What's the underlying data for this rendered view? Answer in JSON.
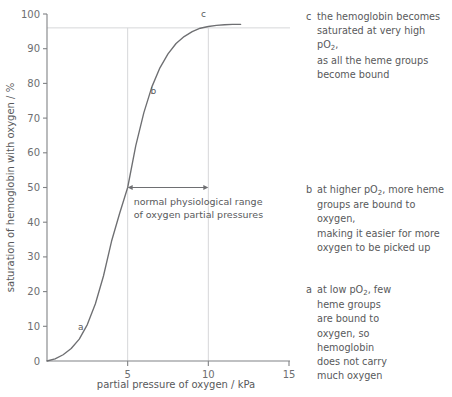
{
  "chart_data": {
    "type": "line",
    "title": "",
    "xlabel": "partial pressure of oxygen / kPa",
    "ylabel": "saturation of hemoglobin with oxygen / %",
    "xlim": [
      0,
      15
    ],
    "ylim": [
      0,
      100
    ],
    "xticks": [
      0,
      5,
      10,
      15
    ],
    "xtick_labels": [
      "0",
      "5",
      "10",
      "15"
    ],
    "yticks": [
      0,
      10,
      20,
      30,
      40,
      50,
      60,
      70,
      80,
      90,
      100
    ],
    "ytick_labels": [
      "0",
      "10",
      "20",
      "30",
      "40",
      "50",
      "60",
      "70",
      "80",
      "90",
      "100"
    ],
    "grid": false,
    "legend": "none",
    "series": [
      {
        "name": "oxyhemoglobin dissociation curve",
        "color": "#6e6f72",
        "x": [
          0.0,
          0.5,
          1.0,
          1.5,
          2.0,
          2.5,
          3.0,
          3.5,
          4.0,
          4.5,
          5.0,
          5.5,
          6.0,
          6.5,
          7.0,
          7.5,
          8.0,
          8.5,
          9.0,
          9.5,
          10.0,
          10.5,
          11.0,
          11.5,
          12.0
        ],
        "y": [
          0.0,
          0.6,
          1.8,
          3.6,
          6.3,
          10.5,
          16.5,
          24.5,
          34.5,
          42.5,
          50.0,
          62.0,
          71.5,
          79.0,
          84.5,
          88.5,
          91.5,
          93.5,
          94.9,
          95.9,
          96.4,
          96.7,
          96.9,
          97.0,
          97.0
        ]
      }
    ],
    "reference_lines": {
      "horizontal": [
        {
          "y": 96,
          "label": ""
        }
      ],
      "vertical": [
        {
          "x": 5,
          "label": ""
        },
        {
          "x": 10,
          "label": ""
        }
      ]
    },
    "curve_point_labels": [
      {
        "id": "a",
        "label": "a",
        "x": 2.1,
        "y": 9
      },
      {
        "id": "b",
        "label": "b",
        "x": 6.6,
        "y": 77
      },
      {
        "id": "c",
        "label": "c",
        "x": 9.7,
        "y": 99
      }
    ],
    "range_arrow": {
      "from_x": 5,
      "to_x": 10,
      "at_y": 50,
      "note_lines": [
        "normal physiological range",
        "of oxygen partial pressures"
      ]
    }
  },
  "annotations": [
    {
      "id": "c",
      "marker": "c",
      "lines": [
        {
          "pre": "the hemoglobin becomes",
          "sub": "",
          "post": ""
        },
        {
          "pre": "saturated at very high pO",
          "sub": "2",
          "post": ","
        },
        {
          "pre": "as all the heme groups",
          "sub": "",
          "post": ""
        },
        {
          "pre": "become bound",
          "sub": "",
          "post": ""
        }
      ]
    },
    {
      "id": "b",
      "marker": "b",
      "lines": [
        {
          "pre": "at higher pO",
          "sub": "2",
          "post": ", more heme"
        },
        {
          "pre": "groups are bound to oxygen,",
          "sub": "",
          "post": ""
        },
        {
          "pre": "making it easier for more",
          "sub": "",
          "post": ""
        },
        {
          "pre": "oxygen to be picked up",
          "sub": "",
          "post": ""
        }
      ]
    },
    {
      "id": "a",
      "marker": "a",
      "lines": [
        {
          "pre": "at low pO",
          "sub": "2",
          "post": ", few"
        },
        {
          "pre": "heme groups",
          "sub": "",
          "post": ""
        },
        {
          "pre": "are bound to",
          "sub": "",
          "post": ""
        },
        {
          "pre": "oxygen, so",
          "sub": "",
          "post": ""
        },
        {
          "pre": "hemoglobin",
          "sub": "",
          "post": ""
        },
        {
          "pre": "does not carry",
          "sub": "",
          "post": ""
        },
        {
          "pre": "much oxygen",
          "sub": "",
          "post": ""
        }
      ]
    }
  ],
  "colors": {
    "curve": "#6e6f72",
    "axis": "#808285",
    "text": "#58595b",
    "guide": "#d6d7d9",
    "background": "#ffffff"
  }
}
